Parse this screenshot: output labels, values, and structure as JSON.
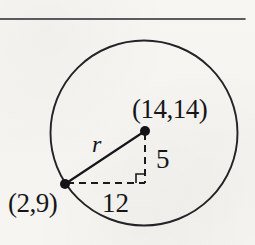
{
  "figure": {
    "type": "geometry-diagram",
    "background_color": "#f6f5f2",
    "ink_color": "#16161a",
    "rule": {
      "name": "top-horizontal-rule",
      "x1": 0,
      "y1": 19,
      "x2": 245,
      "y2": 19,
      "stroke_width": 1.6
    },
    "circle": {
      "center_x": 144,
      "center_y": 133,
      "radius": 93,
      "stroke_width": 1.9
    },
    "points": [
      {
        "name": "center-point",
        "label": "(14,14)",
        "x": 145,
        "y": 131,
        "dot_radius": 5
      },
      {
        "name": "circle-point",
        "label": "(2,9)",
        "x": 65,
        "y": 184,
        "dot_radius": 5
      }
    ],
    "segments": [
      {
        "name": "radius-segment",
        "label": "r",
        "style": "solid",
        "x1": 65,
        "y1": 184,
        "x2": 145,
        "y2": 131,
        "stroke_width": 2.1
      },
      {
        "name": "horizontal-leg",
        "label": "12",
        "style": "dashed",
        "x1": 67,
        "y1": 183,
        "x2": 145,
        "y2": 183,
        "stroke_width": 2.0
      },
      {
        "name": "vertical-leg",
        "label": "5",
        "style": "dashed",
        "x1": 145,
        "y1": 133,
        "x2": 145,
        "y2": 183,
        "stroke_width": 2.0
      }
    ],
    "right_angle_marker": {
      "name": "right-angle-marker",
      "corner_x": 145,
      "corner_y": 183,
      "size": 9,
      "stroke_width": 1.6
    },
    "labels": {
      "center_point": "(14,14)",
      "circle_point": "(2,9)",
      "radius": "r",
      "vertical_leg": "5",
      "horizontal_leg": "12"
    }
  }
}
